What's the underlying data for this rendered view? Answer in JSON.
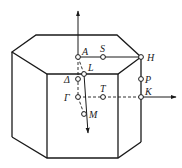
{
  "diagram": {
    "points": {
      "A": "A",
      "S": "S",
      "H": "H",
      "L": "L",
      "Delta": "Δ",
      "P": "P",
      "Gamma": "Γ",
      "T": "T",
      "K": "K",
      "M": "M"
    },
    "colors": {
      "line": "#1a1a1a",
      "background": "#ffffff"
    }
  }
}
